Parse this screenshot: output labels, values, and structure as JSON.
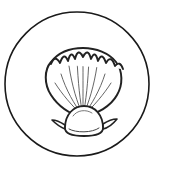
{
  "artwork": {
    "title": "Seashell Icon",
    "subject": "scallop-seashell",
    "style": "line-art outline",
    "canvas": {
      "width": 173,
      "height": 176,
      "background_color": "#ffffff"
    },
    "colors": {
      "background": "#ffffff",
      "outline_stroke": "#1a1a1a",
      "shell_outline_stroke": "#222222",
      "rib_stroke": "#555555",
      "detail_stroke": "#444444",
      "fill": "#ffffff"
    },
    "frame": {
      "shape": "circle",
      "center_x": 77,
      "center_y": 84,
      "radius": 72,
      "stroke_width": 1.6,
      "fill": "none"
    },
    "shell": {
      "name": "scallop-shell",
      "bounds": {
        "left": 44,
        "top": 48,
        "right": 120,
        "bottom": 136
      },
      "hinge_point": {
        "x": 83,
        "y": 118
      },
      "fan_outline_path": "M 83 118 C 70 114 58 106 51 95 C 44 84 44 70 51 62 C 58 53 70 48 83 48 C 96 48 109 53 116 62 C 123 71 123 85 117 95 C 111 106 97 114 83 118 Z",
      "scallop_lobe_count": 9,
      "rib_count": 11,
      "outline_stroke_width": 2.0,
      "rib_stroke_width": 0.9,
      "ribs": [
        "M 83 116 C 72 106 62 94 55 83",
        "M 83 116 C 74 104 66 90 61 74",
        "M 83 116 C 77 102 72 86 69 66",
        "M 83 116 C 80 101 78 83 77 58",
        "M 83 116 C 83 100 83 80 83 54",
        "M 83 116 C 86 101 88 83 89 58",
        "M 83 116 C 89 102 94 86 97 66",
        "M 83 116 C 92 104 100 90 105 74",
        "M 83 116 C 94 106 104 94 111 83"
      ],
      "scallop_arc_path": "M 51 64 q 4 -10 9 -1 q 4 -12 8 -2 q 3 -12 7 -2 q 3 -12 8 -2 q 5 -10 8 2 q 4 -10 7 2 q 4 -10 8 2 q 5 -9 9 3 q 5 -6 8 3",
      "umbo": {
        "name": "shell-umbo",
        "center_x": 83,
        "center_y": 122,
        "outline_path": "M 65 128 C 65 114 74 106 84 106 C 95 106 103 115 103 128 C 103 133 96 136 84 136 C 72 136 65 133 65 128 Z",
        "stroke_width": 1.8,
        "inner_detail_path": "M 69 129 C 76 133 92 133 99 128",
        "left_tab_path": "M 65 125 C 59 121 55 120 52 120 C 56 124 60 127 65 129",
        "right_tab_path": "M 103 124 C 109 120 113 119 117 119 C 113 124 108 128 103 129",
        "highlight_path": "M 73 116 C 77 110 86 109 92 113"
      }
    }
  }
}
